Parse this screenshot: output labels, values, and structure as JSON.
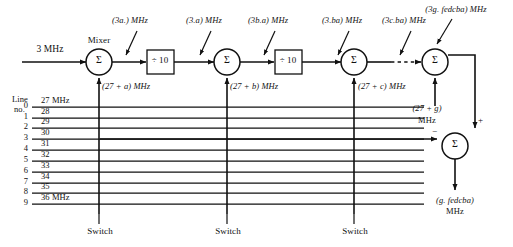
{
  "diagram": {
    "input": {
      "label": "3 MHz"
    },
    "mixer_caption": "Mixer",
    "summer_symbol": "Σ",
    "divider_label": "÷ 10",
    "line_no_label_1": "Line",
    "line_no_label_2": "no.",
    "switch_label": "Switch",
    "plus_sign": "+",
    "minus_sign": "−",
    "top_labels": [
      {
        "text": "(3a.) MHz",
        "x": 130,
        "y": 22
      },
      {
        "text": "(3.a) MHz",
        "x": 204,
        "y": 22
      },
      {
        "text": "(3b.a) MHz",
        "x": 268,
        "y": 22
      },
      {
        "text": "(3.ba) MHz",
        "x": 342,
        "y": 22
      },
      {
        "text": "(3c.ba) MHz",
        "x": 404,
        "y": 22
      },
      {
        "text": "(3g. fedcba) MHz",
        "x": 456,
        "y": 10
      }
    ],
    "offset_labels": [
      {
        "text": "(27 + a) MHz",
        "x": 101,
        "y": 86
      },
      {
        "text": "(27 + b) MHz",
        "x": 227,
        "y": 86
      },
      {
        "text": "(27 + c) MHz",
        "x": 356,
        "y": 86
      }
    ],
    "offset_g": {
      "line1": "(27 + g)",
      "line2": "MHz"
    },
    "output": {
      "line1": "(g. fedcba)",
      "line2": "MHz"
    },
    "switches": [
      {
        "label": "Switch",
        "x": 100
      },
      {
        "label": "Switch",
        "x": 228
      },
      {
        "label": "Switch",
        "x": 355
      }
    ],
    "bus_lines": [
      {
        "no": "0",
        "freq": "27 MHz"
      },
      {
        "no": "1",
        "freq": "28"
      },
      {
        "no": "2",
        "freq": "29"
      },
      {
        "no": "3",
        "freq": "30"
      },
      {
        "no": "4",
        "freq": "31"
      },
      {
        "no": "5",
        "freq": "32"
      },
      {
        "no": "6",
        "freq": "33"
      },
      {
        "no": "7",
        "freq": "34"
      },
      {
        "no": "8",
        "freq": "35"
      },
      {
        "no": "9",
        "freq": "36 MHz"
      }
    ],
    "colors": {
      "ink": "#111111",
      "paper": "#ffffff"
    }
  }
}
